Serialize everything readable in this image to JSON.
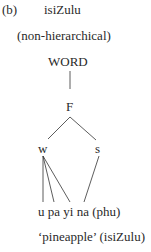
{
  "label": "(b)",
  "language": "isiZulu",
  "subtitle": "(non-hierarchical)",
  "tree": {
    "root": "WORD",
    "foot": "F",
    "weak": "w",
    "strong": "s"
  },
  "segments": "u pa yi na (phu)",
  "gloss": "‘pineapple’ (isiZulu)"
}
